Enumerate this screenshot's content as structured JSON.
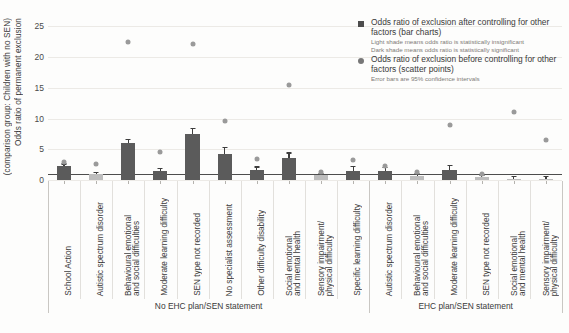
{
  "chart_data": {
    "type": "bar",
    "title": "",
    "xlabel": "",
    "ylabel_line1": "Odds ratio of permanent exclusion",
    "ylabel_line2": "(comparison group: Children with no SEN)",
    "ylim": [
      0,
      27
    ],
    "yticks": [
      0,
      5,
      10,
      15,
      20,
      25
    ],
    "grid": true,
    "legend_position": "top-right",
    "reference_line": 1,
    "groups": [
      {
        "name": "No EHC plan/SEN statement",
        "categories": [
          "School Action",
          "Autistic spectrum disorder",
          "Behavioural emotional and social difficulties",
          "Moderate learning difficulty",
          "SEN type not recorded",
          "No specialist assessment",
          "Other difficulty disability",
          "Social emotional and mental health",
          "Sensory impairment/ physical difficulty",
          "Specific learning difficulty"
        ],
        "bars": [
          2.2,
          0.9,
          6.0,
          1.5,
          7.5,
          4.2,
          1.6,
          3.5,
          0.8,
          1.5
        ],
        "bar_significant": [
          true,
          false,
          true,
          true,
          true,
          true,
          true,
          true,
          false,
          true
        ],
        "error_low": [
          1.8,
          0.6,
          5.4,
          1.1,
          6.6,
          3.1,
          1.1,
          2.6,
          0.5,
          0.9
        ],
        "error_high": [
          2.7,
          1.3,
          6.7,
          2.0,
          8.5,
          5.4,
          2.2,
          4.5,
          1.2,
          2.3
        ],
        "scatter": [
          2.9,
          2.6,
          22.4,
          4.6,
          22.2,
          9.6,
          3.4,
          15.5,
          1.3,
          3.3
        ]
      },
      {
        "name": "EHC plan/SEN statement",
        "categories": [
          "Autistic spectrum disorder",
          "Behavioural emotional and social difficulties",
          "Moderate learning difficulty",
          "SEN type not recorded",
          "Social emotional and mental health",
          "Sensory impairment/ physical difficulty"
        ],
        "bars": [
          1.5,
          0.6,
          1.7,
          0.5,
          0.15,
          0.2
        ],
        "bar_significant": [
          true,
          false,
          true,
          false,
          false,
          false
        ],
        "error_low": [
          1.0,
          0.3,
          1.2,
          0.2,
          0.02,
          0.05
        ],
        "error_high": [
          2.1,
          1.1,
          2.4,
          0.9,
          0.6,
          0.6
        ],
        "scatter": [
          2.3,
          1.3,
          9.0,
          1.0,
          11.0,
          6.5
        ]
      }
    ]
  },
  "legend": {
    "items": [
      {
        "marker": "square",
        "label": "Odds ratio of exclusion after controlling for other factors (bar charts)",
        "sublines": [
          "Light shade means odds ratio is statistically insignificant",
          "Dark shade means odds ratio is statistically significant"
        ]
      },
      {
        "marker": "circle",
        "label": "Odds ratio of exclusion before controlling for other factors (scatter points)",
        "sublines": [
          "Error bars are 95% confidence intervals"
        ]
      }
    ]
  },
  "colors": {
    "bar_dark": "#5b5b5b",
    "bar_light": "#bdbdbd",
    "scatter": "#9a9a9a",
    "grid": "#eceae6",
    "baseline": "#4d4d4d",
    "background": "#fdfdfc"
  }
}
